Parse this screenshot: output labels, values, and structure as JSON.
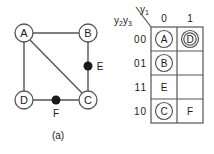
{
  "figure": {
    "background": "#ffffff",
    "line_color": "#555555",
    "text_color": "#1a1a1a"
  },
  "panel_a": {
    "caption": "(a)",
    "type": "graph",
    "nodes": [
      {
        "id": "A",
        "label": "A",
        "x": 24,
        "y": 33,
        "style": "circle"
      },
      {
        "id": "B",
        "label": "B",
        "x": 88,
        "y": 33,
        "style": "circle"
      },
      {
        "id": "C",
        "label": "C",
        "x": 88,
        "y": 100,
        "style": "circle"
      },
      {
        "id": "D",
        "label": "D",
        "x": 24,
        "y": 100,
        "style": "circle"
      }
    ],
    "dots": [
      {
        "id": "E",
        "label": "E",
        "x": 88,
        "y": 66,
        "label_x": 100,
        "label_y": 66
      },
      {
        "id": "F",
        "label": "F",
        "x": 56,
        "y": 100,
        "label_x": 56,
        "label_y": 112
      }
    ],
    "edges": [
      {
        "from": "A",
        "to": "B"
      },
      {
        "from": "A",
        "to": "D"
      },
      {
        "from": "A",
        "to": "C"
      },
      {
        "from": "B",
        "to": "C"
      },
      {
        "from": "D",
        "to": "C"
      }
    ]
  },
  "panel_b": {
    "caption": "(b)",
    "type": "karnaugh-map",
    "col_variable": "y",
    "col_variable_sub": "1",
    "row_variable_1": "y",
    "row_variable_1_sub": "2",
    "row_variable_2": "y",
    "row_variable_2_sub": "3",
    "col_headers": [
      "0",
      "1"
    ],
    "row_headers": [
      "00",
      "01",
      "11",
      "10"
    ],
    "cells": [
      [
        {
          "label": "A",
          "style": "circle"
        },
        {
          "label": "D",
          "style": "double-circle"
        }
      ],
      [
        {
          "label": "B",
          "style": "circle"
        },
        {
          "label": "",
          "style": "empty"
        }
      ],
      [
        {
          "label": "E",
          "style": "plain"
        },
        {
          "label": "",
          "style": "empty"
        }
      ],
      [
        {
          "label": "C",
          "style": "circle"
        },
        {
          "label": "F",
          "style": "plain"
        }
      ]
    ]
  }
}
